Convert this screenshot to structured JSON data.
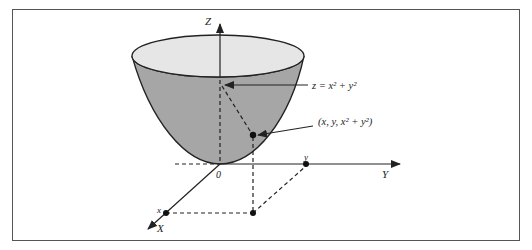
{
  "diagram": {
    "axes": {
      "z": "Z",
      "y": "Y",
      "x": "X"
    },
    "origin": "0",
    "equation_label": "z = x² + y²",
    "point_label": "(x, y, x² + y²)",
    "x_tick": "x",
    "y_tick": "y",
    "colors": {
      "bowl_side": "#a6a6a6",
      "bowl_top": "#e6e6e6",
      "line": "#222222"
    }
  }
}
